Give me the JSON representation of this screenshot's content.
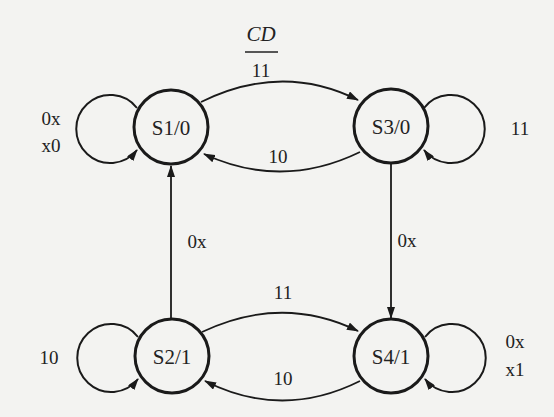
{
  "diagram": {
    "type": "state-machine (Moore)",
    "input_header": {
      "variables": "CD",
      "example_value": "11"
    },
    "states": [
      {
        "id": "S1",
        "output": "0",
        "label": "S1/0"
      },
      {
        "id": "S2",
        "output": "1",
        "label": "S2/1"
      },
      {
        "id": "S3",
        "output": "0",
        "label": "S3/0"
      },
      {
        "id": "S4",
        "output": "1",
        "label": "S4/1"
      }
    ],
    "transitions": [
      {
        "from": "S1",
        "to": "S1",
        "label_lines": [
          "0x",
          "x0"
        ]
      },
      {
        "from": "S1",
        "to": "S3",
        "label": "11"
      },
      {
        "from": "S3",
        "to": "S1",
        "label": "10"
      },
      {
        "from": "S3",
        "to": "S3",
        "label": "11"
      },
      {
        "from": "S3",
        "to": "S4",
        "label": "0x"
      },
      {
        "from": "S2",
        "to": "S1",
        "label": "0x"
      },
      {
        "from": "S2",
        "to": "S2",
        "label": "10"
      },
      {
        "from": "S2",
        "to": "S4",
        "label": "11"
      },
      {
        "from": "S4",
        "to": "S2",
        "label": "10"
      },
      {
        "from": "S4",
        "to": "S4",
        "label_lines": [
          "0x",
          "x1"
        ]
      }
    ]
  },
  "colors": {
    "background": "#f3f3f1",
    "ink": "#1a1a1a"
  }
}
